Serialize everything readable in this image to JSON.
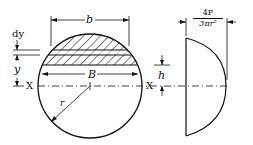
{
  "diagram": {
    "labels": {
      "b": "b",
      "dy": "dy",
      "y": "y",
      "x_left": "X",
      "x_right": "X",
      "B": "B",
      "r": "r",
      "h": "h",
      "max_stress_num": "4F",
      "max_stress_den": "3πr²"
    },
    "elements": [
      "circle-section",
      "hatched-segment",
      "strip-dy",
      "neutral-axis",
      "stress-distribution-curve"
    ]
  }
}
